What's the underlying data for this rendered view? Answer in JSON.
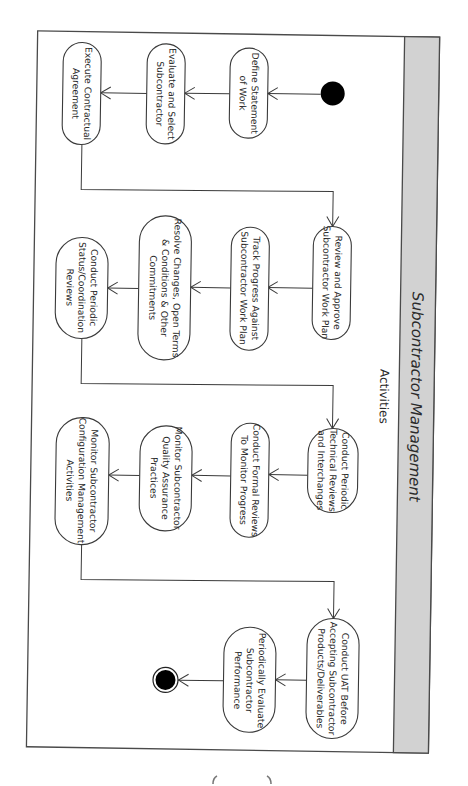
{
  "diagram": {
    "title": "Subcontractor Management",
    "lane_label": "Activities",
    "orientation": "rotated-90-clockwise",
    "colors": {
      "header_band": "#d2d2d2",
      "stroke": "#3a3a3a",
      "node_fill": "#ffffff",
      "start_end": "#000000"
    },
    "nodes": {
      "start": {
        "type": "initial"
      },
      "n1": {
        "lines": [
          "Define Statement",
          "of Work"
        ]
      },
      "n2": {
        "lines": [
          "Evaluate and Select",
          "Subcontractor"
        ]
      },
      "n3": {
        "lines": [
          "Execute Contractual",
          "Agreement"
        ]
      },
      "n4": {
        "lines": [
          "Review and Approve",
          "Subcontractor Work Plan"
        ]
      },
      "n5": {
        "lines": [
          "Track Progress Against",
          "Subcontractor Work Plan"
        ]
      },
      "n6": {
        "lines": [
          "Resolve Changes, Open Terms",
          "& Conditions & Other",
          "Commitments"
        ]
      },
      "n7": {
        "lines": [
          "Conduct Periodic",
          "Status/Coordination",
          "Reviews"
        ]
      },
      "n8": {
        "lines": [
          "Conduct Periodic",
          "Technical Reviews",
          "and Interchanges"
        ]
      },
      "n9": {
        "lines": [
          "Conduct Formal Reviews",
          "To Monitor Progress"
        ]
      },
      "n10": {
        "lines": [
          "Monitor Subcontractor",
          "Quality Assurance",
          "Practices"
        ]
      },
      "n11": {
        "lines": [
          "Monitor Subcontractor",
          "Configuration Management",
          "Activities"
        ]
      },
      "n12": {
        "lines": [
          "Conduct UAT Before",
          "Accepting Subcontractor",
          "Products/Deliverables"
        ]
      },
      "n13": {
        "lines": [
          "Periodically Evaluate",
          "Subcontractor",
          "Performance"
        ]
      },
      "end": {
        "type": "final"
      }
    },
    "edges": [
      [
        "start",
        "n1"
      ],
      [
        "n1",
        "n2"
      ],
      [
        "n2",
        "n3"
      ],
      [
        "n3",
        "n4"
      ],
      [
        "n4",
        "n5"
      ],
      [
        "n5",
        "n6"
      ],
      [
        "n6",
        "n7"
      ],
      [
        "n7",
        "n8"
      ],
      [
        "n8",
        "n9"
      ],
      [
        "n9",
        "n10"
      ],
      [
        "n10",
        "n11"
      ],
      [
        "n11",
        "n12"
      ],
      [
        "n12",
        "n13"
      ],
      [
        "n13",
        "end"
      ]
    ]
  }
}
